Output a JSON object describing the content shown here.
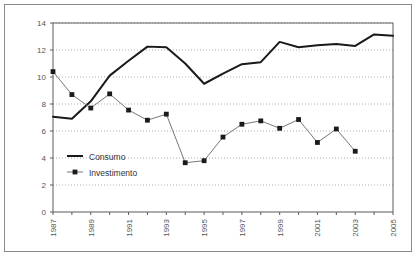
{
  "chart_data": {
    "type": "line",
    "title": "",
    "subtitle": "",
    "xlabel": "",
    "ylabel": "",
    "x": [
      1987,
      1988,
      1989,
      1990,
      1991,
      1992,
      1993,
      1994,
      1995,
      1996,
      1997,
      1998,
      1999,
      2000,
      2001,
      2002,
      2003,
      2004,
      2005
    ],
    "xtick_labels": [
      "1987",
      "1989",
      "1991",
      "1993",
      "1995",
      "1997",
      "1999",
      "2001",
      "2003",
      "2005"
    ],
    "xtick_values": [
      1987,
      1989,
      1991,
      1993,
      1995,
      1997,
      1999,
      2001,
      2003,
      2005
    ],
    "ytick_labels": [
      "0",
      "2",
      "4",
      "6",
      "8",
      "10",
      "12",
      "14"
    ],
    "ytick_values": [
      0,
      2,
      4,
      6,
      8,
      10,
      12,
      14
    ],
    "xlim": [
      1987,
      2005
    ],
    "ylim": [
      0,
      14
    ],
    "grid": "horizontal-dotted",
    "legend_position": "inside-lower-left",
    "series": [
      {
        "name": "Consumo",
        "marker": "none",
        "color": "#1a1a1a",
        "line_width": 2.0,
        "values": [
          7.05,
          6.9,
          8.2,
          10.1,
          11.2,
          12.25,
          12.2,
          11.0,
          9.5,
          10.25,
          10.95,
          11.1,
          12.6,
          12.2,
          12.35,
          12.45,
          12.3,
          13.15,
          13.05
        ]
      },
      {
        "name": "Investimento",
        "marker": "square",
        "color": "#777777",
        "line_width": 1.0,
        "values": [
          10.4,
          8.7,
          7.7,
          8.75,
          7.55,
          6.8,
          7.25,
          3.65,
          3.8,
          5.55,
          6.5,
          6.75,
          6.2,
          6.85,
          5.15,
          6.15,
          4.5,
          null,
          null
        ]
      }
    ]
  },
  "legend": {
    "items": [
      {
        "label": "Consumo"
      },
      {
        "label": "Investimento"
      }
    ]
  }
}
